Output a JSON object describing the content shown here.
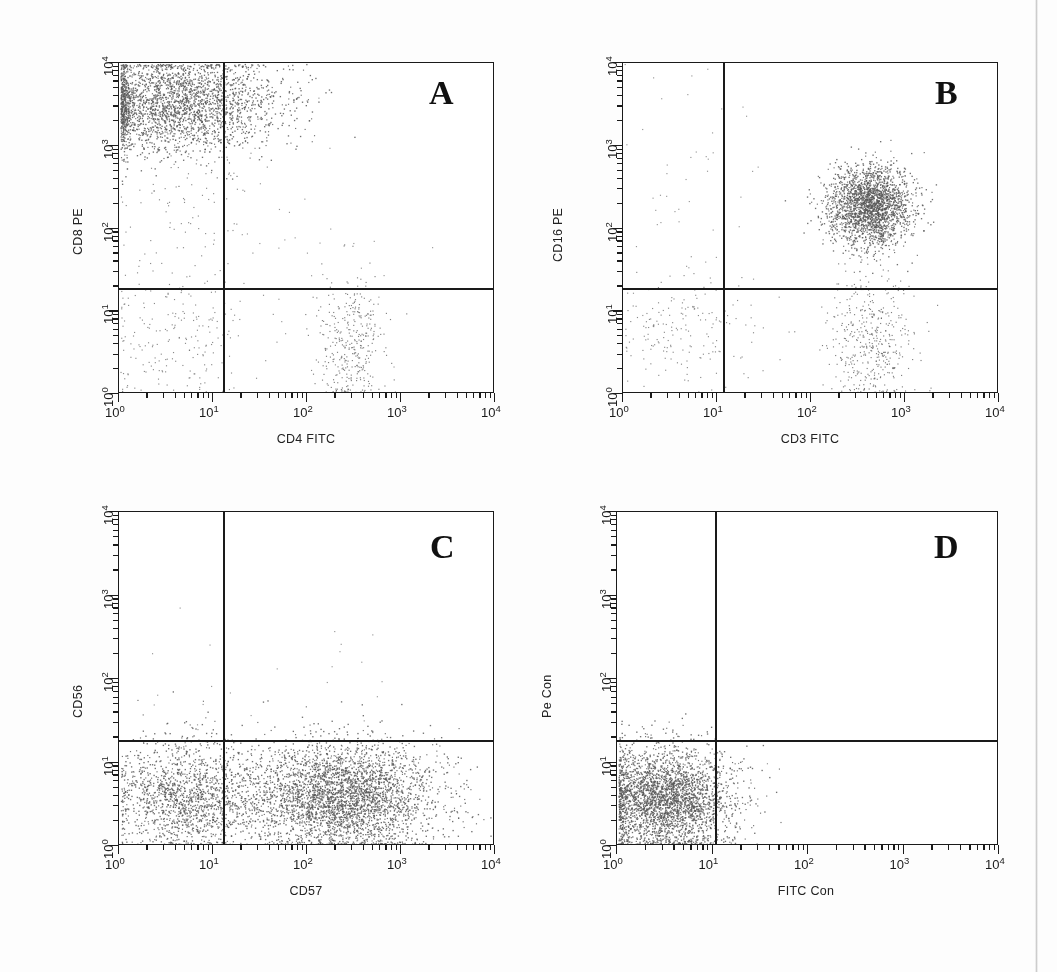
{
  "figure": {
    "background_color": "#fdfdfd",
    "axis_color": "#1a1a1a",
    "dot_color": "#6b6b6b",
    "dense_dot_color": "#585858"
  },
  "chart_data": [
    {
      "type": "scatter",
      "panel": "A",
      "title": "A",
      "xlabel": "CD4 FITC",
      "ylabel": "CD8 PE",
      "xscale": "log",
      "yscale": "log",
      "xlim": [
        1,
        10000
      ],
      "ylim": [
        1,
        10000
      ],
      "xticks": [
        "10^0",
        "10^1",
        "10^2",
        "10^3",
        "10^4"
      ],
      "yticks": [
        "10^0",
        "10^1",
        "10^2",
        "10^3",
        "10^4"
      ],
      "xtick_labels": [
        "10",
        "10",
        "10",
        "10",
        "10"
      ],
      "xtick_exponents": [
        "0",
        "1",
        "2",
        "3",
        "4"
      ],
      "ytick_labels": [
        "10",
        "10",
        "10",
        "10",
        "10"
      ],
      "ytick_exponents": [
        "0",
        "1",
        "2",
        "3",
        "4"
      ],
      "grid": false,
      "legend": "none",
      "quadrant_gate_x": 13,
      "quadrant_gate_y": 18,
      "populations": [
        {
          "name": "CD8+CD4- upper left cluster",
          "quadrant": "upper-left",
          "x_center": 4.0,
          "y_center": 3200,
          "x_spread": 0.55,
          "y_spread": 0.3,
          "count": 2600,
          "density": "high"
        },
        {
          "name": "CD8 intermediate tail",
          "quadrant": "upper-left",
          "x_center": 4.5,
          "y_center": 200,
          "x_spread": 0.45,
          "y_spread": 0.55,
          "count": 110,
          "density": "low"
        },
        {
          "name": "CD4- CD8- double negative",
          "quadrant": "lower-left",
          "x_center": 4.0,
          "y_center": 4.5,
          "x_spread": 0.45,
          "y_spread": 0.38,
          "count": 210,
          "density": "low"
        },
        {
          "name": "CD4+ single positive",
          "quadrant": "lower-right",
          "x_center": 290,
          "y_center": 4.0,
          "x_spread": 0.17,
          "y_spread": 0.4,
          "count": 360,
          "density": "medium"
        },
        {
          "name": "scattered events upper right",
          "quadrant": "upper-right",
          "x_center": 150,
          "y_center": 60,
          "x_spread": 0.55,
          "y_spread": 0.7,
          "count": 30,
          "density": "sparse"
        }
      ]
    },
    {
      "type": "scatter",
      "panel": "B",
      "title": "B",
      "xlabel": "CD3 FITC",
      "ylabel": "CD16 PE",
      "xscale": "log",
      "yscale": "log",
      "xlim": [
        1,
        10000
      ],
      "ylim": [
        1,
        10000
      ],
      "xtick_labels": [
        "10",
        "10",
        "10",
        "10",
        "10"
      ],
      "xtick_exponents": [
        "0",
        "1",
        "2",
        "3",
        "4"
      ],
      "ytick_labels": [
        "10",
        "10",
        "10",
        "10",
        "10"
      ],
      "ytick_exponents": [
        "0",
        "1",
        "2",
        "3",
        "4"
      ],
      "grid": false,
      "legend": "none",
      "quadrant_gate_x": 12,
      "quadrant_gate_y": 18,
      "populations": [
        {
          "name": "CD3+CD16+ cluster",
          "quadrant": "upper-right",
          "x_center": 420,
          "y_center": 190,
          "x_spread": 0.22,
          "y_spread": 0.24,
          "count": 2200,
          "density": "high"
        },
        {
          "name": "CD3+CD16- T cells",
          "quadrant": "lower-right",
          "x_center": 430,
          "y_center": 4.5,
          "x_spread": 0.22,
          "y_spread": 0.4,
          "count": 450,
          "density": "medium"
        },
        {
          "name": "CD3-CD16- lymphocytes",
          "quadrant": "lower-left",
          "x_center": 4.5,
          "y_center": 6.0,
          "x_spread": 0.42,
          "y_spread": 0.33,
          "count": 180,
          "density": "low"
        },
        {
          "name": "CD3-CD16+ sparse",
          "quadrant": "upper-left",
          "x_center": 4.0,
          "y_center": 300,
          "x_spread": 0.45,
          "y_spread": 0.7,
          "count": 45,
          "density": "sparse"
        }
      ]
    },
    {
      "type": "scatter",
      "panel": "C",
      "title": "C",
      "xlabel": "CD57",
      "ylabel": "CD56",
      "xscale": "log",
      "yscale": "log",
      "xlim": [
        1,
        10000
      ],
      "ylim": [
        1,
        10000
      ],
      "xtick_labels": [
        "10",
        "10",
        "10",
        "10",
        "10"
      ],
      "xtick_exponents": [
        "0",
        "1",
        "2",
        "3",
        "4"
      ],
      "ytick_labels": [
        "10",
        "10",
        "10",
        "10",
        "10"
      ],
      "ytick_exponents": [
        "0",
        "1",
        "2",
        "3",
        "4"
      ],
      "grid": false,
      "legend": "none",
      "quadrant_gate_x": 13,
      "quadrant_gate_y": 18,
      "populations": [
        {
          "name": "CD57- CD56- band",
          "quadrant": "lower-left",
          "x_center": 5.0,
          "y_center": 4.0,
          "x_spread": 0.4,
          "y_spread": 0.33,
          "count": 1500,
          "density": "high"
        },
        {
          "name": "CD57+ CD56- broad band",
          "quadrant": "lower-right",
          "x_center": 230,
          "y_center": 4.0,
          "x_spread": 0.52,
          "y_spread": 0.33,
          "count": 3400,
          "density": "high"
        },
        {
          "name": "CD56+ rare events",
          "quadrant": "upper-right",
          "x_center": 300,
          "y_center": 110,
          "x_spread": 0.35,
          "y_spread": 0.45,
          "count": 12,
          "density": "sparse"
        },
        {
          "name": "CD56+ CD57- rare events",
          "quadrant": "upper-left",
          "x_center": 5.0,
          "y_center": 60,
          "x_spread": 0.35,
          "y_spread": 0.45,
          "count": 12,
          "density": "sparse"
        }
      ]
    },
    {
      "type": "scatter",
      "panel": "D",
      "title": "D",
      "xlabel": "FITC Con",
      "ylabel": "Pe Con",
      "xscale": "log",
      "yscale": "log",
      "xlim": [
        1,
        10000
      ],
      "ylim": [
        1,
        10000
      ],
      "xtick_labels": [
        "10",
        "10",
        "10",
        "10",
        "10"
      ],
      "xtick_exponents": [
        "0",
        "1",
        "2",
        "3",
        "4"
      ],
      "ytick_labels": [
        "10",
        "10",
        "10",
        "10",
        "10"
      ],
      "ytick_exponents": [
        "0",
        "1",
        "2",
        "3",
        "4"
      ],
      "grid": false,
      "legend": "none",
      "quadrant_gate_x": 13,
      "quadrant_gate_y": 18,
      "populations": [
        {
          "name": "isotype control negative cluster",
          "quadrant": "lower-left",
          "x_center": 3.2,
          "y_center": 3.6,
          "x_spread": 0.36,
          "y_spread": 0.32,
          "count": 3000,
          "density": "high"
        },
        {
          "name": "stray events",
          "quadrant": "lower-right",
          "x_center": 18,
          "y_center": 8,
          "x_spread": 0.12,
          "y_spread": 0.3,
          "count": 3,
          "density": "sparse"
        }
      ]
    }
  ],
  "panels": {
    "A": {
      "letter": "A",
      "xlabel": "CD4 FITC",
      "ylabel": "CD8 PE",
      "ticks": [
        {
          "mantissa": "10",
          "exp": "0"
        },
        {
          "mantissa": "10",
          "exp": "1"
        },
        {
          "mantissa": "10",
          "exp": "2"
        },
        {
          "mantissa": "10",
          "exp": "3"
        },
        {
          "mantissa": "10",
          "exp": "4"
        }
      ]
    },
    "B": {
      "letter": "B",
      "xlabel": "CD3 FITC",
      "ylabel": "CD16 PE",
      "ticks": [
        {
          "mantissa": "10",
          "exp": "0"
        },
        {
          "mantissa": "10",
          "exp": "1"
        },
        {
          "mantissa": "10",
          "exp": "2"
        },
        {
          "mantissa": "10",
          "exp": "3"
        },
        {
          "mantissa": "10",
          "exp": "4"
        }
      ]
    },
    "C": {
      "letter": "C",
      "xlabel": "CD57",
      "ylabel": "CD56",
      "ticks": [
        {
          "mantissa": "10",
          "exp": "0"
        },
        {
          "mantissa": "10",
          "exp": "1"
        },
        {
          "mantissa": "10",
          "exp": "2"
        },
        {
          "mantissa": "10",
          "exp": "3"
        },
        {
          "mantissa": "10",
          "exp": "4"
        }
      ]
    },
    "D": {
      "letter": "D",
      "xlabel": "FITC Con",
      "ylabel": "Pe Con",
      "ticks": [
        {
          "mantissa": "10",
          "exp": "0"
        },
        {
          "mantissa": "10",
          "exp": "1"
        },
        {
          "mantissa": "10",
          "exp": "2"
        },
        {
          "mantissa": "10",
          "exp": "3"
        },
        {
          "mantissa": "10",
          "exp": "4"
        }
      ]
    }
  }
}
